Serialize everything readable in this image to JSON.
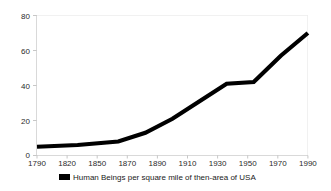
{
  "chart_data": {
    "type": "line",
    "title": "",
    "subtitle": "",
    "xlabel": "",
    "ylabel": "",
    "x": [
      1790,
      1820,
      1850,
      1870,
      1890,
      1910,
      1930,
      1950,
      1970,
      1990
    ],
    "categories": [
      "1790",
      "1820",
      "1850",
      "1870",
      "1890",
      "1910",
      "1930",
      "1950",
      "1970",
      "1990"
    ],
    "series": [
      {
        "name": "Human Beings per square mile of then-area of USA",
        "values": [
          5,
          6,
          8,
          13,
          21,
          31,
          41,
          42,
          57,
          70
        ],
        "color": "#000000"
      }
    ],
    "xlim": [
      1790,
      1990
    ],
    "ylim": [
      0,
      80
    ],
    "ytick_labels": [
      "0",
      "20",
      "40",
      "60",
      "80"
    ],
    "yticks": [
      0,
      20,
      40,
      60,
      80
    ],
    "xtick_labels": [
      "1790",
      "1820",
      "1850",
      "1870",
      "1890",
      "1910",
      "1930",
      "1950",
      "1970",
      "1990"
    ],
    "grid": false,
    "legend_position": "bottom",
    "legend": [
      {
        "label": "Human Beings per square mile of then-area of USA",
        "marker": "square",
        "color": "#000000"
      }
    ]
  },
  "axes": {
    "y": {
      "tick_0": "0",
      "tick_20": "20",
      "tick_40": "40",
      "tick_60": "60",
      "tick_80": "80"
    },
    "x": {
      "tick_1790": "1790",
      "tick_1820": "1820",
      "tick_1850": "1850",
      "tick_1870": "1870",
      "tick_1890": "1890",
      "tick_1910": "1910",
      "tick_1930": "1930",
      "tick_1950": "1950",
      "tick_1970": "1970",
      "tick_1990": "1990"
    }
  },
  "legend": {
    "entry_label": "Human Beings per square mile of then-area of USA"
  },
  "colors": {
    "line": "#000000",
    "axis": "#cfcfcf",
    "text": "#1a1a1a",
    "background": "#ffffff"
  }
}
